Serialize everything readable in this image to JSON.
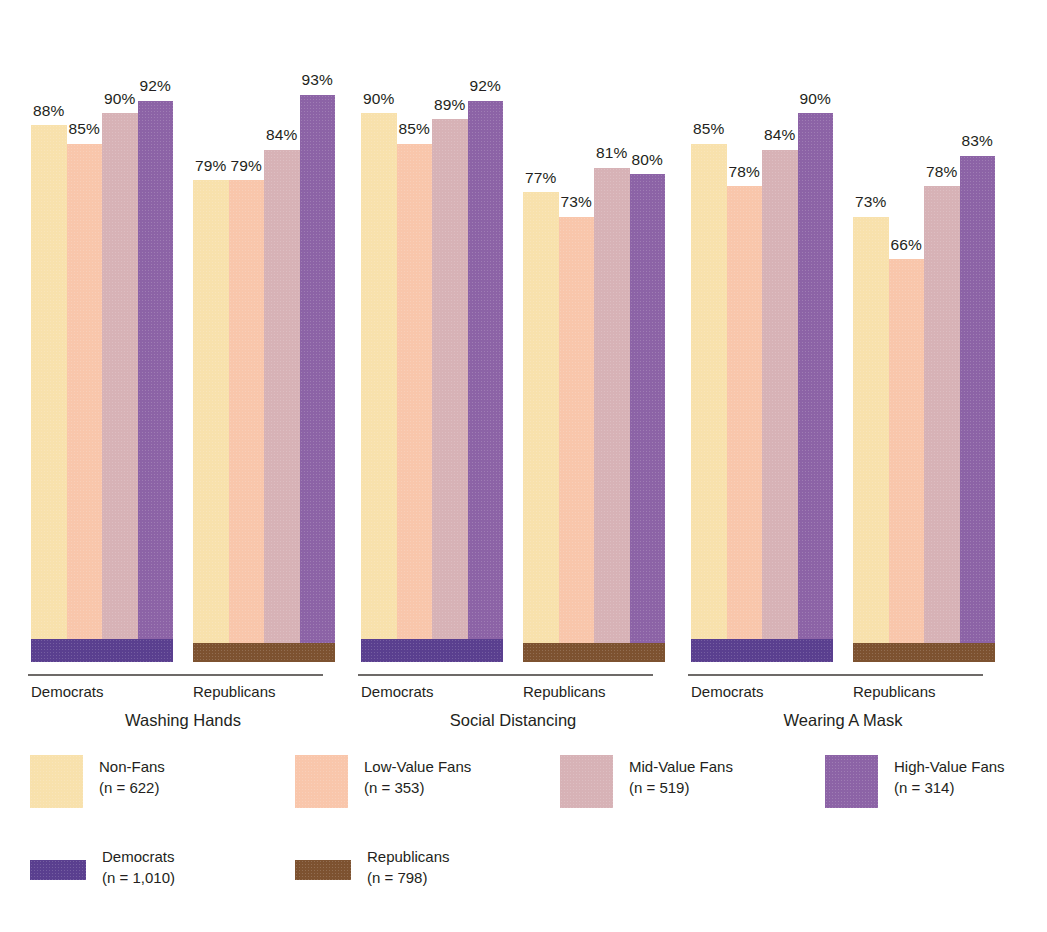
{
  "chart_data": {
    "type": "bar",
    "title": "",
    "subtitle": "",
    "xlabel": "",
    "ylabel": "",
    "ylim": [
      0,
      100
    ],
    "grid": false,
    "value_suffix": "%",
    "legend_position": "bottom",
    "categories": [
      "Non-Fans",
      "Low-Value Fans",
      "Mid-Value Fans",
      "High-Value Fans"
    ],
    "parties": [
      "Democrats",
      "Republicans"
    ],
    "topics": [
      "Washing Hands",
      "Social Distancing",
      "Wearing A Mask"
    ],
    "groups": [
      {
        "topic": "Washing Hands",
        "clusters": [
          {
            "party": "Democrats",
            "values": [
              88,
              85,
              90,
              92
            ],
            "labels": [
              "88%",
              "85%",
              "90%",
              "92%"
            ]
          },
          {
            "party": "Republicans",
            "values": [
              79,
              79,
              84,
              93
            ],
            "labels": [
              "79%",
              "79%",
              "84%",
              "93%"
            ]
          }
        ]
      },
      {
        "topic": "Social Distancing",
        "clusters": [
          {
            "party": "Democrats",
            "values": [
              90,
              85,
              89,
              92
            ],
            "labels": [
              "90%",
              "85%",
              "89%",
              "92%"
            ]
          },
          {
            "party": "Republicans",
            "values": [
              77,
              73,
              81,
              80
            ],
            "labels": [
              "77%",
              "73%",
              "81%",
              "80%"
            ]
          }
        ]
      },
      {
        "topic": "Wearing A Mask",
        "clusters": [
          {
            "party": "Democrats",
            "values": [
              85,
              78,
              84,
              90
            ],
            "labels": [
              "85%",
              "78%",
              "84%",
              "90%"
            ]
          },
          {
            "party": "Republicans",
            "values": [
              73,
              66,
              78,
              83
            ],
            "labels": [
              "73%",
              "66%",
              "78%",
              "83%"
            ]
          }
        ]
      }
    ],
    "colors": {
      "non_fans": "#f8e1ac",
      "low_value_fans": "#f9c6ab",
      "mid_value_fans": "#d7b2b6",
      "high_value_fans": "#8c63a6",
      "democrats": "#5a3f8f",
      "republicans": "#7d5230",
      "axis": "#6d6a68",
      "text": "#231f20"
    }
  },
  "legend": {
    "category_items": [
      {
        "label": "Non-Fans",
        "n": "(n = 622)",
        "color_key": "non_fans"
      },
      {
        "label": "Low-Value Fans",
        "n": "(n = 353)",
        "color_key": "low_value_fans"
      },
      {
        "label": "Mid-Value Fans",
        "n": "(n = 519)",
        "color_key": "mid_value_fans"
      },
      {
        "label": "High-Value Fans",
        "n": "(n = 314)",
        "color_key": "high_value_fans"
      }
    ],
    "party_items": [
      {
        "label": "Democrats",
        "n": "(n = 1,010)",
        "color_key": "democrats"
      },
      {
        "label": "Republicans",
        "n": "(n = 798)",
        "color_key": "republicans"
      }
    ]
  }
}
